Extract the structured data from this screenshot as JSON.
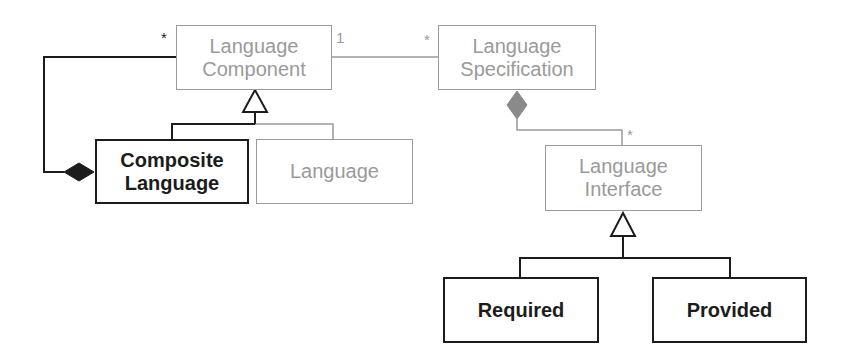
{
  "diagram": {
    "type": "uml-class-diagram",
    "colors": {
      "highlight": "#1c1c1c",
      "muted": "#9a9a9a",
      "background": "#ffffff"
    },
    "classes": {
      "language_component": {
        "label": "Language\nComponent",
        "style": "muted"
      },
      "language_specification": {
        "label": "Language\nSpecification",
        "style": "muted"
      },
      "composite_language": {
        "label": "Composite\nLanguage",
        "style": "highlight"
      },
      "language": {
        "label": "Language",
        "style": "muted"
      },
      "language_interface": {
        "label": "Language\nInterface",
        "style": "muted"
      },
      "required": {
        "label": "Required",
        "style": "highlight"
      },
      "provided": {
        "label": "Provided",
        "style": "highlight"
      }
    },
    "relationships": [
      {
        "type": "composition",
        "from": "Composite Language",
        "to": "Language Component",
        "target_multiplicity": "*"
      },
      {
        "type": "association",
        "from": "Language Component",
        "to": "Language Specification",
        "from_multiplicity": "1",
        "to_multiplicity": "*"
      },
      {
        "type": "composition",
        "from": "Language Specification",
        "to": "Language Interface",
        "target_multiplicity": "*"
      },
      {
        "type": "generalization",
        "parent": "Language Component",
        "children": [
          "Composite Language",
          "Language"
        ]
      },
      {
        "type": "generalization",
        "parent": "Language Interface",
        "children": [
          "Required",
          "Provided"
        ]
      }
    ],
    "multiplicities": {
      "composite_to_component": "*",
      "component_end": "1",
      "specification_end": "*",
      "interface_end": "*"
    }
  }
}
